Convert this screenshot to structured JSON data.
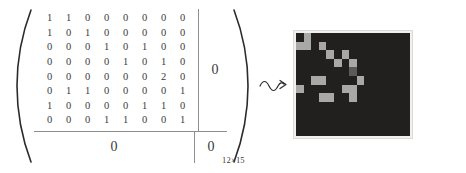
{
  "figure": {
    "caption_subscript": "12×15",
    "arrow_glyph": "squiggly-arrow-right",
    "zero_block_label": "0"
  },
  "matrix": {
    "subscript": "12×15",
    "block_B_label": "0",
    "block_C_label": "0",
    "block_D_label": "0",
    "rows": [
      [
        1,
        1,
        0,
        0,
        0,
        0,
        0,
        0
      ],
      [
        1,
        0,
        1,
        0,
        0,
        0,
        0,
        0
      ],
      [
        0,
        0,
        0,
        1,
        0,
        1,
        0,
        0
      ],
      [
        0,
        0,
        0,
        0,
        1,
        0,
        1,
        0
      ],
      [
        0,
        0,
        0,
        0,
        0,
        0,
        2,
        0
      ],
      [
        0,
        1,
        1,
        0,
        0,
        0,
        0,
        1
      ],
      [
        1,
        0,
        0,
        0,
        0,
        1,
        1,
        0
      ],
      [
        0,
        0,
        0,
        1,
        1,
        0,
        0,
        1
      ]
    ]
  },
  "colors": {
    "background": "#ffffff",
    "ink": "#3a3a3a",
    "rule": "#8e8e8e",
    "pixel_dark": "#221f1f",
    "pixel_light": "#a8a8a8",
    "pixel_mid": "#5a5a5a",
    "frame": "#f2f0ee"
  },
  "pixel_image": {
    "rows": 12,
    "cols": 15,
    "legend": {
      "0": "dark",
      "1": "light",
      "2": "mid"
    },
    "cells": [
      [
        0,
        1,
        0,
        0,
        0,
        0,
        0,
        0,
        0,
        0,
        0,
        0,
        0,
        0,
        0
      ],
      [
        1,
        1,
        0,
        1,
        0,
        0,
        0,
        0,
        0,
        0,
        0,
        0,
        0,
        0,
        0
      ],
      [
        0,
        0,
        0,
        0,
        1,
        0,
        1,
        0,
        0,
        0,
        0,
        0,
        0,
        0,
        0
      ],
      [
        0,
        0,
        0,
        0,
        0,
        1,
        0,
        1,
        0,
        0,
        0,
        0,
        0,
        0,
        0
      ],
      [
        0,
        0,
        0,
        0,
        0,
        0,
        0,
        2,
        0,
        0,
        0,
        0,
        0,
        0,
        0
      ],
      [
        0,
        0,
        1,
        1,
        0,
        0,
        0,
        0,
        1,
        0,
        0,
        0,
        0,
        0,
        0
      ],
      [
        1,
        0,
        0,
        0,
        0,
        0,
        1,
        1,
        0,
        0,
        0,
        0,
        0,
        0,
        0
      ],
      [
        0,
        0,
        0,
        1,
        1,
        0,
        0,
        1,
        0,
        0,
        0,
        0,
        0,
        0,
        0
      ],
      [
        0,
        0,
        0,
        0,
        0,
        0,
        0,
        0,
        0,
        0,
        0,
        0,
        0,
        0,
        0
      ],
      [
        0,
        0,
        0,
        0,
        0,
        0,
        0,
        0,
        0,
        0,
        0,
        0,
        0,
        0,
        0
      ],
      [
        0,
        0,
        0,
        0,
        0,
        0,
        0,
        0,
        0,
        0,
        0,
        0,
        0,
        0,
        0
      ],
      [
        0,
        0,
        0,
        0,
        0,
        0,
        0,
        0,
        0,
        0,
        0,
        0,
        0,
        0,
        0
      ]
    ]
  }
}
